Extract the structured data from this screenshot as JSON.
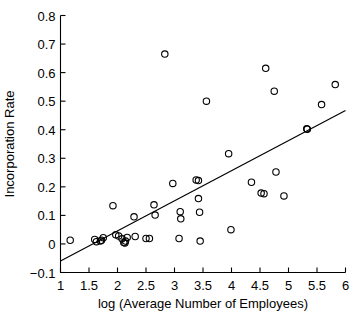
{
  "chart_data": {
    "type": "scatter",
    "title": "",
    "xlabel": "log (Average Number of Employees)",
    "ylabel": "Incorporation Rate",
    "xlim": [
      1,
      6
    ],
    "ylim": [
      -0.1,
      0.8
    ],
    "grid": false,
    "legend": null,
    "xticks": [
      1,
      1.5,
      2,
      2.5,
      3,
      3.5,
      4,
      4.5,
      5,
      5.5,
      6
    ],
    "xtick_labels": [
      "1",
      "1.5",
      "2",
      "2.5",
      "3",
      "3.5",
      "4",
      "4.5",
      "5",
      "5.5",
      "6"
    ],
    "yticks": [
      -0.1,
      0,
      0.1,
      0.2,
      0.3,
      0.4,
      0.5,
      0.6,
      0.7,
      0.8
    ],
    "ytick_labels": [
      "−0.1",
      "0",
      "0.1",
      "0.2",
      "0.3",
      "0.4",
      "0.5",
      "0.6",
      "0.7",
      "0.8"
    ],
    "marker": "open-circle",
    "marker_color": "#000000",
    "points": [
      {
        "x": 1.17,
        "y": 0.013
      },
      {
        "x": 1.6,
        "y": 0.016
      },
      {
        "x": 1.63,
        "y": 0.008
      },
      {
        "x": 1.7,
        "y": 0.01
      },
      {
        "x": 1.72,
        "y": 0.013
      },
      {
        "x": 1.75,
        "y": 0.022
      },
      {
        "x": 1.92,
        "y": 0.134
      },
      {
        "x": 1.97,
        "y": 0.032
      },
      {
        "x": 2.02,
        "y": 0.028
      },
      {
        "x": 2.08,
        "y": 0.018
      },
      {
        "x": 2.11,
        "y": 0.005
      },
      {
        "x": 2.13,
        "y": 0.003
      },
      {
        "x": 2.14,
        "y": 0.01
      },
      {
        "x": 2.17,
        "y": 0.023
      },
      {
        "x": 2.29,
        "y": 0.095
      },
      {
        "x": 2.31,
        "y": 0.026
      },
      {
        "x": 2.5,
        "y": 0.019
      },
      {
        "x": 2.56,
        "y": 0.019
      },
      {
        "x": 2.64,
        "y": 0.137
      },
      {
        "x": 2.66,
        "y": 0.101
      },
      {
        "x": 2.83,
        "y": 0.665
      },
      {
        "x": 2.97,
        "y": 0.212
      },
      {
        "x": 3.08,
        "y": 0.019
      },
      {
        "x": 3.1,
        "y": 0.113
      },
      {
        "x": 3.11,
        "y": 0.088
      },
      {
        "x": 3.38,
        "y": 0.224
      },
      {
        "x": 3.42,
        "y": 0.222
      },
      {
        "x": 3.42,
        "y": 0.159
      },
      {
        "x": 3.44,
        "y": 0.111
      },
      {
        "x": 3.45,
        "y": 0.01
      },
      {
        "x": 3.56,
        "y": 0.5
      },
      {
        "x": 3.95,
        "y": 0.316
      },
      {
        "x": 3.99,
        "y": 0.05
      },
      {
        "x": 4.35,
        "y": 0.216
      },
      {
        "x": 4.52,
        "y": 0.178
      },
      {
        "x": 4.57,
        "y": 0.176
      },
      {
        "x": 4.6,
        "y": 0.615
      },
      {
        "x": 4.75,
        "y": 0.535
      },
      {
        "x": 4.78,
        "y": 0.252
      },
      {
        "x": 4.92,
        "y": 0.168
      },
      {
        "x": 5.32,
        "y": 0.403
      },
      {
        "x": 5.33,
        "y": 0.402
      },
      {
        "x": 5.58,
        "y": 0.488
      },
      {
        "x": 5.82,
        "y": 0.558
      }
    ],
    "fit_line": {
      "type": "linear-regression",
      "x0": 1.0,
      "y0": -0.06,
      "x1": 6.0,
      "y1": 0.467
    }
  }
}
